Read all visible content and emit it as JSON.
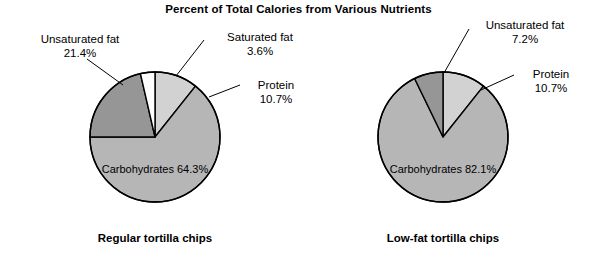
{
  "chart_data": {
    "type": "pie",
    "title": "Percent of Total Calories from Various Nutrients",
    "legend_position": "none",
    "grid": false,
    "charts": [
      {
        "caption": "Regular tortilla chips",
        "categories": [
          "Protein",
          "Carbohydrates",
          "Unsaturated fat",
          "Saturated fat"
        ],
        "values": [
          10.7,
          64.3,
          21.4,
          3.6
        ],
        "value_labels": [
          "10.7%",
          "64.3%",
          "21.4%",
          "3.6%"
        ],
        "colors": [
          "#d2d2d2",
          "#b6b6b6",
          "#969696",
          "#ffffff"
        ],
        "inside_label": {
          "name": "Carbohydrates",
          "value": "64.3%"
        },
        "callouts": [
          {
            "name": "Unsaturated fat",
            "value": "21.4%"
          },
          {
            "name": "Saturated fat",
            "value": "3.6%"
          },
          {
            "name": "Protein",
            "value": "10.7%"
          }
        ]
      },
      {
        "caption": "Low-fat tortilla chips",
        "categories": [
          "Protein",
          "Carbohydrates",
          "Unsaturated fat"
        ],
        "values": [
          10.7,
          82.1,
          7.2
        ],
        "value_labels": [
          "10.7%",
          "82.1%",
          "7.2%"
        ],
        "colors": [
          "#d2d2d2",
          "#b6b6b6",
          "#969696"
        ],
        "inside_label": {
          "name": "Carbohydrates",
          "value": "82.1%"
        },
        "callouts": [
          {
            "name": "Unsaturated fat",
            "value": "7.2%"
          },
          {
            "name": "Protein",
            "value": "10.7%"
          }
        ]
      }
    ]
  },
  "geometry": {
    "pies": [
      {
        "cx": 155,
        "cy": 137,
        "r": 65,
        "start_angle": 0
      },
      {
        "cx": 443,
        "cy": 137,
        "r": 65,
        "start_angle": 0
      }
    ],
    "stroke": "#000000",
    "stroke_width": 1.4
  },
  "annotations": {
    "left_unsat": {
      "x": 18,
      "y": 33
    },
    "left_sat": {
      "x": 208,
      "y": 31
    },
    "left_protein": {
      "x": 243,
      "y": 79
    },
    "left_inside": {
      "x": 155,
      "y": 163
    },
    "left_caption": {
      "x": 155,
      "y": 232
    },
    "right_unsat": {
      "x": 473,
      "y": 19
    },
    "right_protein": {
      "x": 518,
      "y": 68
    },
    "right_inside": {
      "x": 443,
      "y": 163
    },
    "right_caption": {
      "x": 443,
      "y": 232
    }
  },
  "leaders": [
    {
      "name": "leader-left-unsaturated",
      "x1": 87,
      "y1": 59,
      "x2": 123,
      "y2": 85
    },
    {
      "name": "leader-left-saturated",
      "x1": 204,
      "y1": 40,
      "x2": 176,
      "y2": 76
    },
    {
      "name": "leader-left-protein",
      "x1": 240,
      "y1": 85,
      "x2": 209,
      "y2": 97
    },
    {
      "name": "leader-right-unsaturated",
      "x1": 469,
      "y1": 29,
      "x2": 444,
      "y2": 73
    },
    {
      "name": "leader-right-protein",
      "x1": 514,
      "y1": 75,
      "x2": 481,
      "y2": 90
    }
  ]
}
